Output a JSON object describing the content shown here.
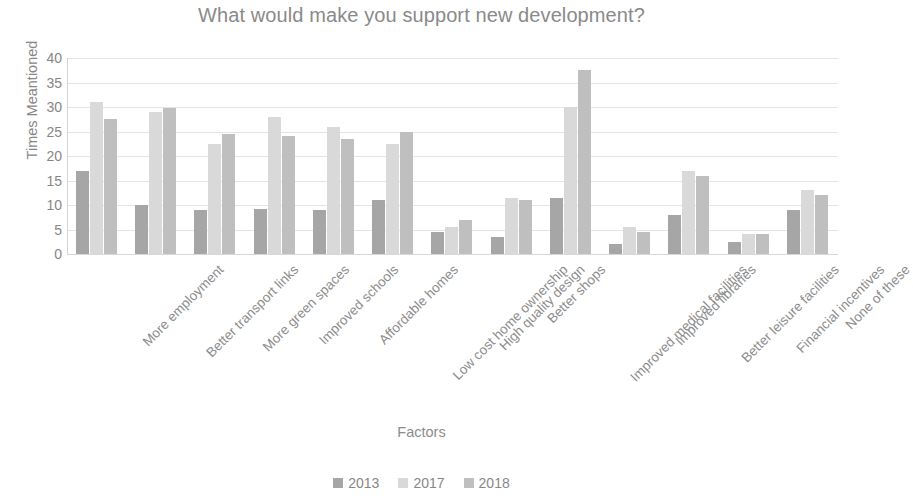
{
  "chart_data": {
    "type": "bar",
    "title": "What would make you support new development?",
    "xlabel": "Factors",
    "ylabel": "Times Meantioned",
    "ylim": [
      0,
      40
    ],
    "ytick_step": 5,
    "yticks": [
      40,
      35,
      30,
      25,
      20,
      15,
      10,
      5,
      0
    ],
    "grid": true,
    "legend_position": "bottom",
    "categories": [
      "More employment",
      "Better transport links",
      "More green spaces",
      "Improved schools",
      "Affordable homes",
      "Low cost home ownership",
      "High quality design",
      "Better shops",
      "Improved medical facilities",
      "Improved libraries",
      "Better leisure facilities",
      "Financial incentives",
      "None of these"
    ],
    "series": [
      {
        "name": "2013",
        "color": "#a6a6a6",
        "values": [
          17,
          10,
          9,
          9.2,
          9,
          11,
          4.5,
          3.5,
          11.5,
          2,
          8,
          2.5,
          9
        ]
      },
      {
        "name": "2017",
        "color": "#d9d9d9",
        "values": [
          31,
          29,
          22.5,
          28,
          26,
          22.5,
          5.5,
          11.5,
          30,
          5.5,
          17,
          4,
          13
        ]
      },
      {
        "name": "2018",
        "color": "#bfbfbf",
        "values": [
          27.5,
          29.8,
          24.5,
          24,
          23.5,
          25,
          7,
          11,
          37.5,
          4.5,
          16,
          4,
          12
        ]
      }
    ]
  },
  "colors": {
    "series_2013": "#a6a6a6",
    "series_2017": "#d9d9d9",
    "series_2018": "#bfbfbf",
    "gridline": "#e4e4e4",
    "text": "#8c8c8c",
    "background": "#ffffff"
  }
}
